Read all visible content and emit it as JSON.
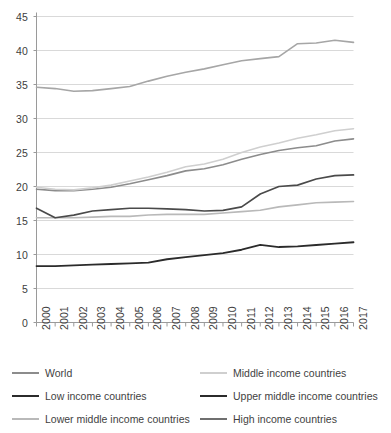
{
  "chart_data": {
    "type": "line",
    "title": "",
    "subtitle": "",
    "xlabel": "",
    "ylabel": "",
    "xlim": [
      2000,
      2017
    ],
    "ylim": [
      0,
      45
    ],
    "ytick_step": 5,
    "grid": true,
    "legend_position": "bottom",
    "legend_columns": 2,
    "x": [
      2000,
      2001,
      2002,
      2003,
      2004,
      2005,
      2006,
      2007,
      2008,
      2009,
      2010,
      2011,
      2012,
      2013,
      2014,
      2015,
      2016,
      2017
    ],
    "xtick_labels": [
      "2000",
      "2001",
      "2002",
      "2003",
      "2004",
      "2005",
      "2006",
      "2007",
      "2008",
      "2009",
      "2010",
      "2011",
      "2012",
      "2013",
      "2014",
      "2015",
      "2016",
      "2017"
    ],
    "ytick_labels": [
      "0",
      "5",
      "10",
      "15",
      "20",
      "25",
      "30",
      "35",
      "40",
      "45"
    ],
    "series": [
      {
        "name": "World",
        "color": "#8c8c8c",
        "width": 1.6,
        "values": [
          19.6,
          19.4,
          19.4,
          19.6,
          19.9,
          20.4,
          21.0,
          21.6,
          22.3,
          22.6,
          23.2,
          24.0,
          24.7,
          25.3,
          25.7,
          26.0,
          26.7,
          27.0
        ]
      },
      {
        "name": "Low income countries",
        "color": "#2b2b2b",
        "width": 1.8,
        "values": [
          8.3,
          8.3,
          8.4,
          8.5,
          8.6,
          8.7,
          8.8,
          9.3,
          9.6,
          9.9,
          10.2,
          10.7,
          11.4,
          11.1,
          11.2,
          11.4,
          11.6,
          11.8
        ]
      },
      {
        "name": "Lower middle income countries",
        "color": "#b9b9b9",
        "width": 1.6,
        "values": [
          15.4,
          15.4,
          15.4,
          15.5,
          15.6,
          15.6,
          15.8,
          15.9,
          15.9,
          15.9,
          16.1,
          16.3,
          16.5,
          17.0,
          17.3,
          17.6,
          17.7,
          17.8
        ]
      },
      {
        "name": "Middle income countries",
        "color": "#cfcfcf",
        "width": 1.6,
        "values": [
          19.9,
          19.6,
          19.5,
          19.8,
          20.2,
          20.8,
          21.4,
          22.1,
          22.9,
          23.3,
          24.0,
          25.0,
          25.8,
          26.4,
          27.1,
          27.6,
          28.2,
          28.5
        ]
      },
      {
        "name": "Upper middle income countries",
        "color": "#4a4a4a",
        "width": 1.7,
        "values": [
          16.8,
          15.4,
          15.8,
          16.4,
          16.6,
          16.8,
          16.8,
          16.7,
          16.6,
          16.4,
          16.5,
          17.0,
          18.9,
          20.0,
          20.2,
          21.1,
          21.6,
          21.7
        ]
      },
      {
        "name": "High income countries",
        "color": "#a6a6a6",
        "width": 1.6,
        "values": [
          34.6,
          34.4,
          34.0,
          34.1,
          34.4,
          34.7,
          35.5,
          36.2,
          36.8,
          37.3,
          37.9,
          38.5,
          38.8,
          39.1,
          41.0,
          41.1,
          41.5,
          41.2
        ]
      }
    ]
  },
  "legend": {
    "items": [
      {
        "label": "World",
        "color": "#8c8c8c",
        "thickness": 1.6
      },
      {
        "label": "Middle income countries",
        "color": "#cfcfcf",
        "thickness": 1.6
      },
      {
        "label": "Low income countries",
        "color": "#2b2b2b",
        "thickness": 2.2
      },
      {
        "label": "Upper middle income countries",
        "color": "#2b2b2b",
        "thickness": 2.4
      },
      {
        "label": "Lower middle income countries",
        "color": "#b9b9b9",
        "thickness": 1.6
      },
      {
        "label": "High income countries",
        "color": "#6f6f6f",
        "thickness": 1.9
      }
    ]
  },
  "axis": {
    "line_color": "#9a9a9a",
    "grid_color": "#d9d9d9",
    "tick_color": "#9a9a9a"
  }
}
